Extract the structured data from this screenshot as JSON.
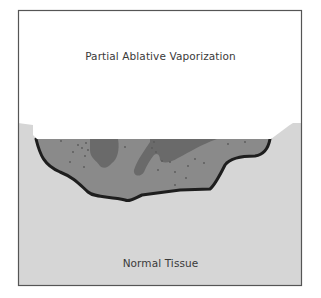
{
  "diagram": {
    "title_label": "Partial Ablative Vaporization",
    "bottom_label": "Normal Tissue",
    "colors": {
      "background": "#ffffff",
      "frame_border": "#555555",
      "normal_tissue": "#d6d6d6",
      "ablated_zone": "#8a8a8a",
      "dark_islands": "#6a6a6a",
      "crater_outline": "#1e1e1e",
      "vapor_area": "#ffffff"
    }
  }
}
